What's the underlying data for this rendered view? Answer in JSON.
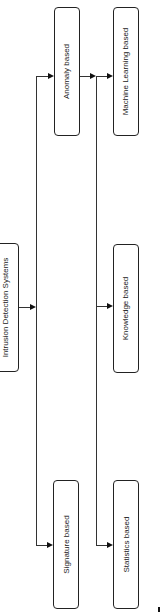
{
  "diagram": {
    "root": {
      "label": "Intrusion Detection Systems"
    },
    "level1": [
      {
        "label": "Anomaly based"
      },
      {
        "label": "Signature based"
      }
    ],
    "level2": [
      {
        "label": "Machine Learning based"
      },
      {
        "label": "Knowledge based"
      },
      {
        "label": "Statistics based"
      }
    ],
    "edges": [
      {
        "from": "Intrusion Detection Systems",
        "to": "Anomaly based"
      },
      {
        "from": "Intrusion Detection Systems",
        "to": "Signature based"
      },
      {
        "from": "Anomaly based",
        "to": "Machine Learning based"
      },
      {
        "from": "Anomaly based",
        "to": "Knowledge based"
      },
      {
        "from": "Anomaly based",
        "to": "Statistics based"
      }
    ],
    "orientation": "rotated-90-ccw"
  }
}
